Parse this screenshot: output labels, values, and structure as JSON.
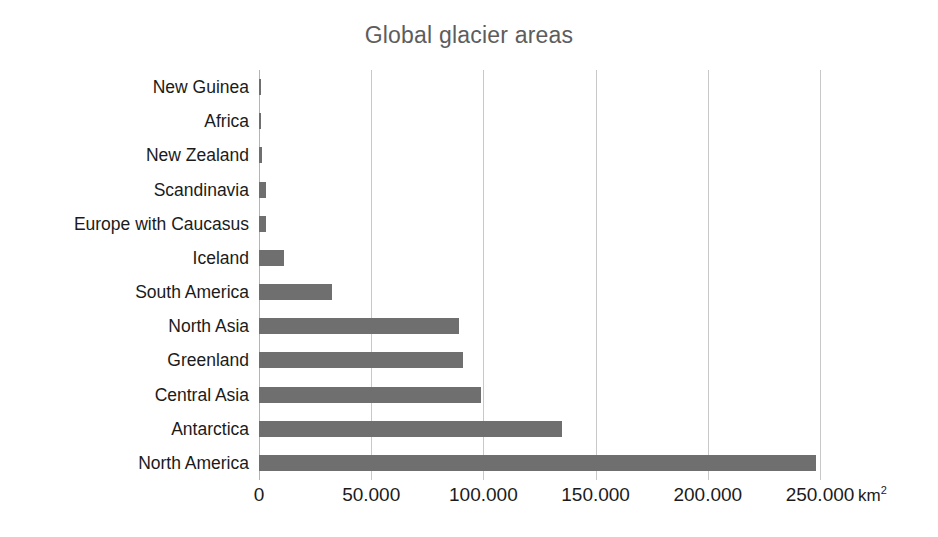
{
  "chart_data": {
    "type": "bar",
    "orientation": "horizontal",
    "title": "Global glacier areas",
    "xlabel": "km²",
    "ylabel": "",
    "xlim": [
      0,
      260000
    ],
    "grid": true,
    "legend": "none",
    "unit_label": "km²",
    "categories": [
      "New Guinea",
      "Africa",
      "New Zealand",
      "Scandinavia",
      "Europe with Caucasus",
      "Iceland",
      "South America",
      "North Asia",
      "Greenland",
      "Central Asia",
      "Antarctica",
      "North America"
    ],
    "values": [
      200,
      300,
      1200,
      3000,
      3000,
      11000,
      32500,
      89000,
      91000,
      99000,
      135000,
      248000
    ],
    "tick_values": [
      0,
      50000,
      100000,
      150000,
      200000,
      250000
    ],
    "tick_labels": [
      "0",
      "50.000",
      "100.000",
      "150.000",
      "200.000",
      "250.000"
    ],
    "colors": {
      "bar": "#706f6f",
      "title": "#5d5d5d",
      "grid": "#c8c8c8",
      "axis": "#b4b4b4",
      "text": "#1b1b1b",
      "background": "#ffffff"
    }
  }
}
